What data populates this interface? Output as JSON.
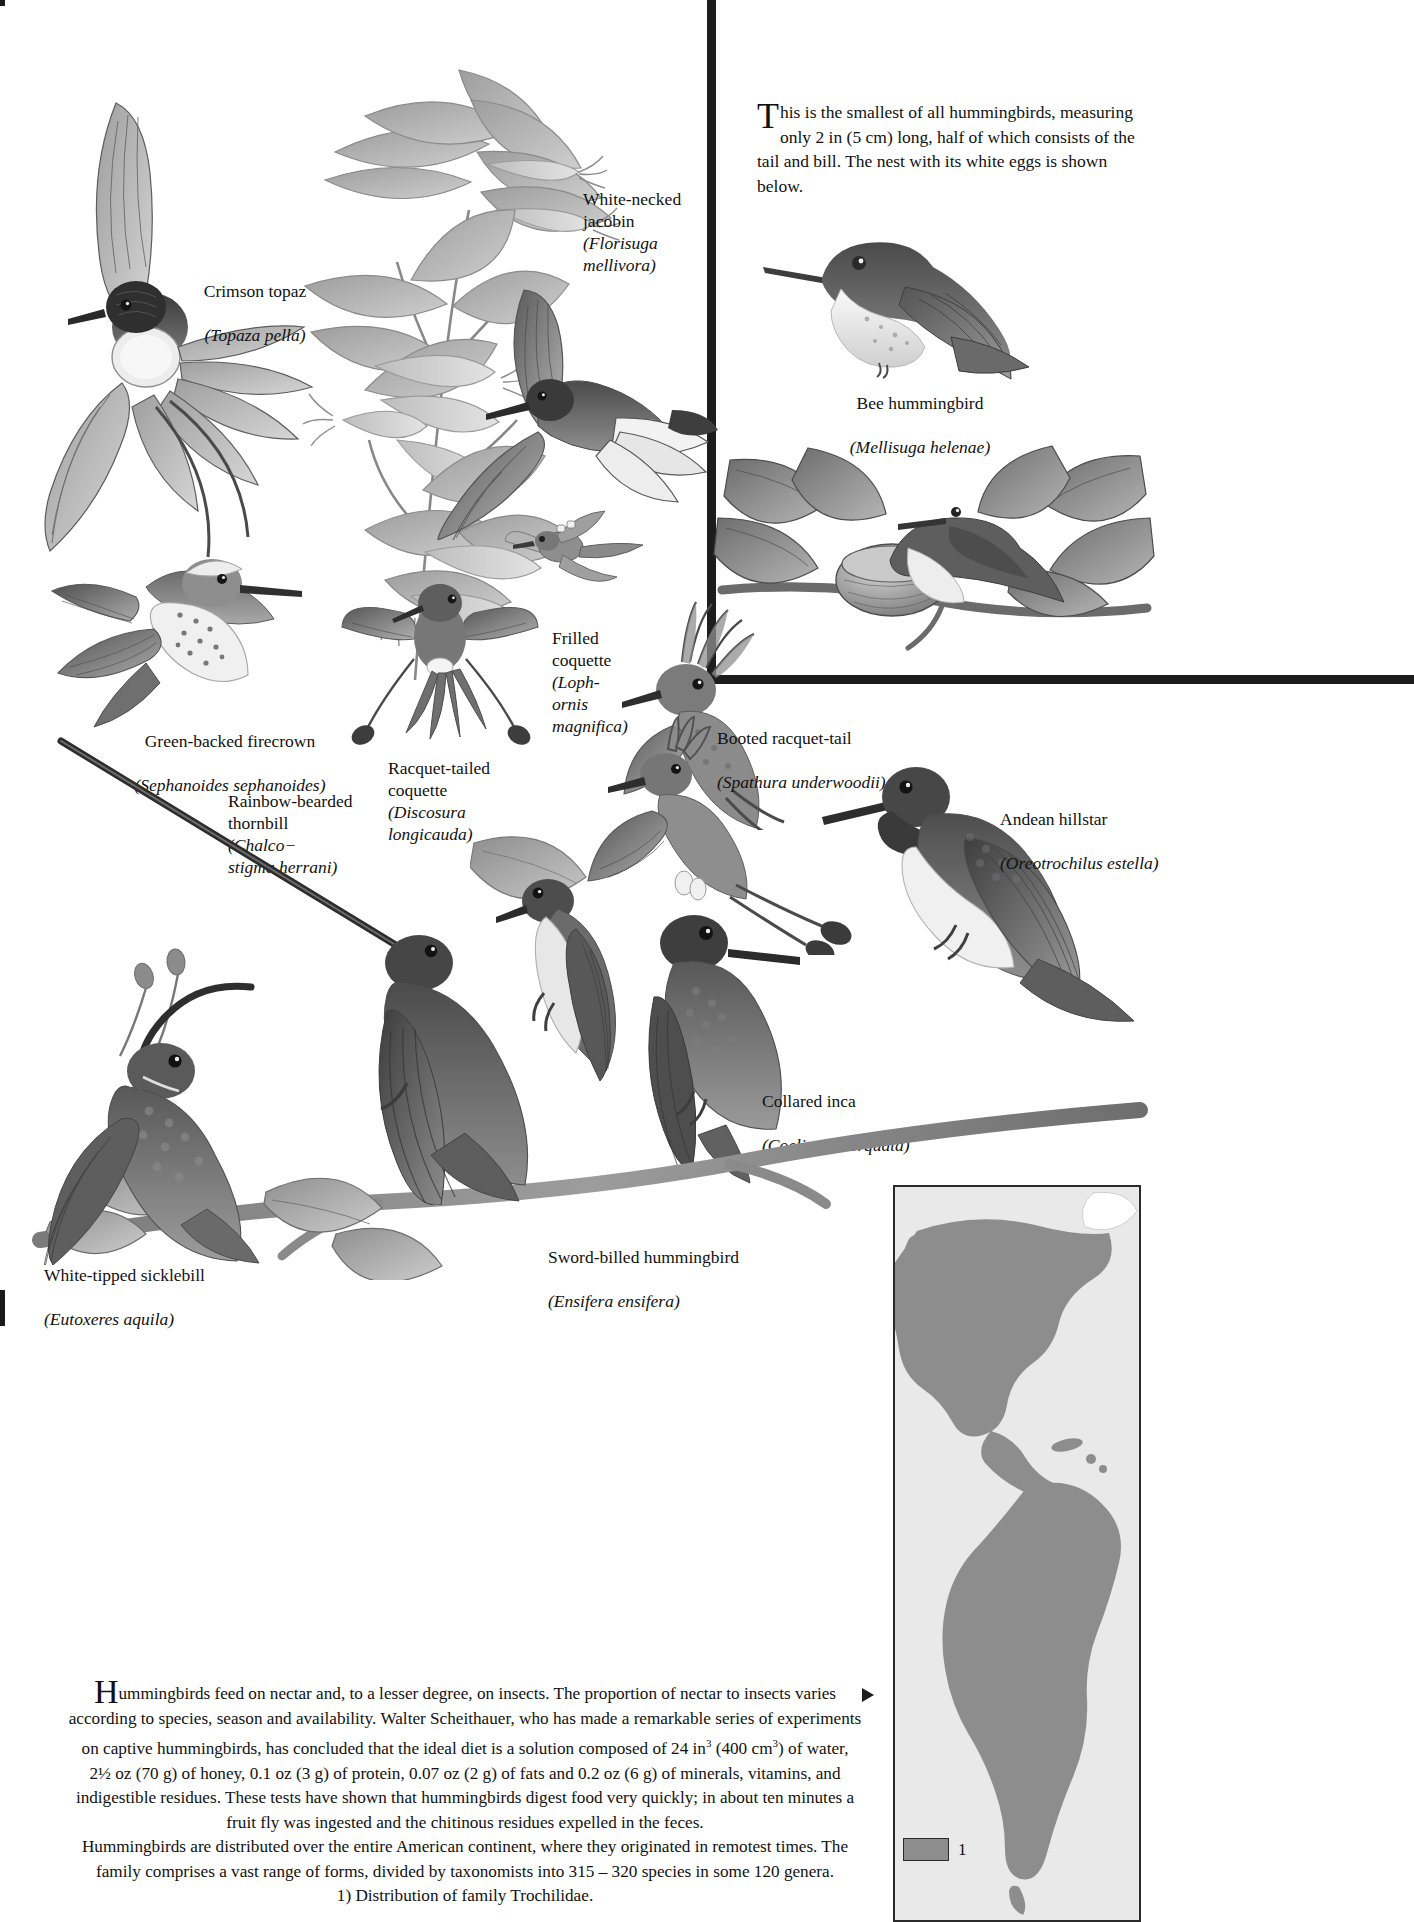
{
  "inset": {
    "intro_drop": "T",
    "intro_text": "his is the smallest of all hummingbirds, measuring only 2 in (5 cm) long, half of which consists of the tail and bill. The nest with its white eggs is shown below."
  },
  "labels": {
    "white_necked_jacobin": {
      "common": "White-necked\njacobin",
      "latin": "(Florisuga\nmellivora)"
    },
    "crimson_topaz": {
      "common": "Crimson topaz",
      "latin": "(Topaza pella)"
    },
    "bee_hummingbird": {
      "common": "Bee hummingbird",
      "latin": "(Mellisuga helenae)"
    },
    "frilled_coquette": {
      "common": "Frilled\ncoquette",
      "latin": "(Loph-\nornis\nmagnifica)"
    },
    "booted_racquet_tail": {
      "common": "Booted racquet-tail",
      "latin": "(Spathura underwoodii)"
    },
    "green_backed_firecrown": {
      "common": "Green-backed firecrown",
      "latin": "(Sephanoides sephanoides)"
    },
    "racquet_tailed_coquette": {
      "common": "Racquet-tailed\ncoquette",
      "latin": "(Discosura\nlongicauda)"
    },
    "rainbow_bearded_thornbill": {
      "common": "Rainbow-bearded\nthornbill",
      "latin": "(Chalco−\nstigma herrani)"
    },
    "andean_hillstar": {
      "common": "Andean hillstar",
      "latin": "(Oreotrochilus estella)"
    },
    "collared_inca": {
      "common": "Collared inca",
      "latin": "(Coeligena torquata)"
    },
    "white_tipped_sicklebill": {
      "common": "White-tipped sicklebill",
      "latin": "(Eutoxeres aquila)"
    },
    "sword_billed_hummingbird": {
      "common": "Sword-billed hummingbird",
      "latin": "(Ensifera ensifera)"
    }
  },
  "body_text": {
    "drop": "H",
    "line1": "ummingbirds feed on nectar and, to a lesser degree, on insects. The proportion of nectar to insects varies",
    "line2": "according to species, season and availability. Walter Scheithauer, who has made a remarkable series of experiments",
    "line3_a": "on captive hummingbirds, has concluded that the ideal diet is a solution composed of 24 in",
    "line3_sup": "3",
    "line3_b": " (400 cm",
    "line3_sup2": "3",
    "line3_c": ") of water,",
    "line4": "2½ oz (70 g) of honey, 0.1 oz (3 g) of protein, 0.07 oz (2 g) of fats and 0.2 oz (6 g) of minerals, vitamins, and",
    "line5": "indigestible residues. These tests have shown that hummingbirds digest food very quickly; in about ten minutes a",
    "line6": "fruit fly was ingested and the chitinous residues expelled in the feces.",
    "line7": "Hummingbirds are distributed over the entire American continent, where they originated in remotest times. The",
    "line8": "family comprises a vast range of forms, divided by taxonomists into 315 – 320 species in some 120 genera.",
    "line9": "1) Distribution of family Trochilidae."
  },
  "map": {
    "legend_number": "1",
    "swatch_color": "#8d8d8d",
    "background_color": "#e9e9e9"
  },
  "colors": {
    "ink": "#111111",
    "rule": "#1d1d1d",
    "paper": "#ffffff"
  }
}
